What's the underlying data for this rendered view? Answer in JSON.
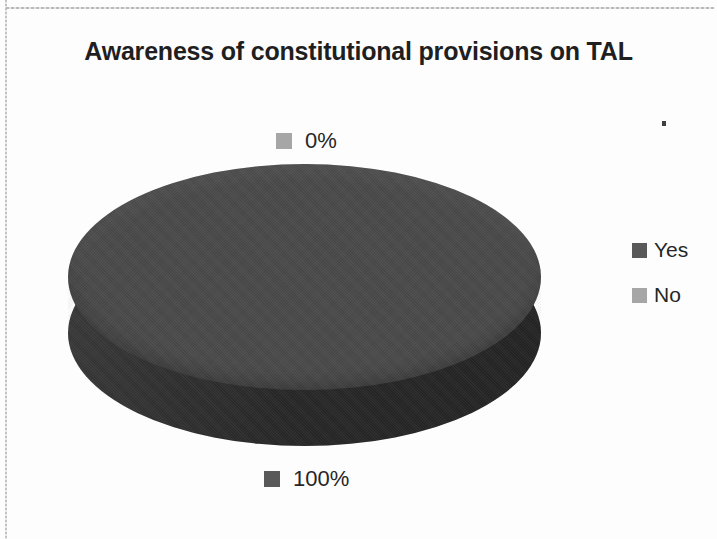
{
  "chart_data": {
    "type": "pie",
    "title": "Awareness of constitutional provisions on TAL",
    "subtitle": "",
    "xlabel": "",
    "ylabel": "",
    "three_d": true,
    "categories": [
      "Yes",
      "No"
    ],
    "values": [
      100,
      0
    ],
    "data_labels": [
      "100%",
      "0%"
    ],
    "colors": [
      "#595959",
      "#a6a6a6"
    ],
    "legend_position": "right",
    "grid": false
  },
  "page": {
    "background_color": "#fdfdfd",
    "frame_color": "#b9b9b9"
  },
  "title": {
    "text": "Awareness of constitutional provisions on TAL"
  },
  "labels": {
    "zero": {
      "value": "0%",
      "swatch_color": "#a6a6a6"
    },
    "full": {
      "value": "100%",
      "swatch_color": "#595959"
    }
  },
  "legend": {
    "items": [
      {
        "label": "Yes",
        "color": "#595959"
      },
      {
        "label": "No",
        "color": "#a6a6a6"
      }
    ]
  },
  "pie": {
    "top_color": "#4a4a4a",
    "side_color": "#2c2c2c"
  }
}
